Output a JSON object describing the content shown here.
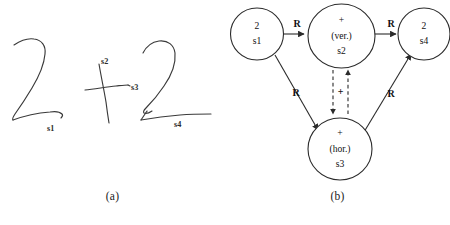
{
  "figure": {
    "width": 450,
    "height": 225,
    "background": "#ffffff",
    "ink_color": "#3a3a3a",
    "line_color": "#2b2b2b",
    "text_color": "#111111"
  },
  "panel_a": {
    "caption": "(a)",
    "stroke_labels": [
      {
        "id": "s1",
        "text": "s1",
        "x": 47,
        "y": 129
      },
      {
        "id": "s2",
        "text": "s2",
        "x": 101,
        "y": 62
      },
      {
        "id": "s3",
        "text": "s3",
        "x": 131,
        "y": 88
      },
      {
        "id": "s4",
        "text": "s4",
        "x": 174,
        "y": 125
      }
    ]
  },
  "panel_b": {
    "caption": "(b)",
    "nodes": [
      {
        "id": "s1",
        "lines": [
          "2",
          "s1"
        ],
        "cx": 32,
        "cy": 34,
        "rx": 26.5,
        "ry": 26
      },
      {
        "id": "s2",
        "lines": [
          "+",
          "(ver.)",
          "s2"
        ],
        "cx": 116.5,
        "cy": 36,
        "rx": 33.5,
        "ry": 32
      },
      {
        "id": "s3",
        "lines": [
          "+",
          "(hor.)",
          "s3"
        ],
        "cx": 115,
        "cy": 149,
        "rx": 32,
        "ry": 31
      },
      {
        "id": "s4",
        "lines": [
          "2",
          "s4"
        ],
        "cx": 199,
        "cy": 34,
        "rx": 26,
        "ry": 26
      }
    ],
    "edges": [
      {
        "id": "s1-s2",
        "label": "R",
        "style": "solid",
        "label_x": 72,
        "label_y": 26
      },
      {
        "id": "s2-s4",
        "label": "R",
        "style": "solid",
        "label_x": 166,
        "label_y": 26
      },
      {
        "id": "s1-s3",
        "label": "R",
        "style": "solid",
        "label_x": 71,
        "label_y": 94
      },
      {
        "id": "s3-s4",
        "label": "R",
        "style": "solid",
        "label_x": 165,
        "label_y": 95
      },
      {
        "id": "s2-s3-dashed",
        "label": "+",
        "style": "dashed",
        "label_x": 115,
        "label_y": 93
      }
    ]
  }
}
